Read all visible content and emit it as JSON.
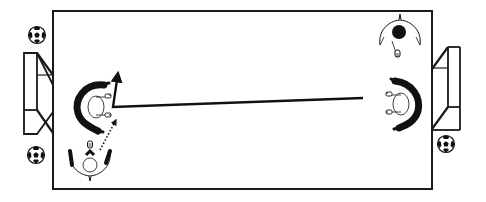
{
  "diagram": {
    "title": "Soccer passing drill",
    "field": {
      "x": 53,
      "y": 11,
      "width": 379,
      "height": 178,
      "line_color": "#1a1a1a",
      "fill": "#ffffff"
    },
    "goals": [
      {
        "id": "left-goal",
        "side": "left",
        "x": 24,
        "y": 53,
        "width": 30,
        "height": 81
      },
      {
        "id": "right-goal",
        "side": "right",
        "x": 431,
        "y": 47,
        "width": 29,
        "height": 83
      }
    ],
    "balls": [
      {
        "id": "ball-top-left",
        "cx": 37,
        "cy": 35,
        "r": 9
      },
      {
        "id": "ball-bottom-left",
        "cx": 36,
        "cy": 155,
        "r": 9
      },
      {
        "id": "ball-bottom-right",
        "cx": 446,
        "cy": 144,
        "r": 9
      }
    ],
    "players": [
      {
        "id": "player-left-keeper",
        "label": "Left player (facing right)",
        "cx": 92,
        "cy": 105,
        "facing": "right",
        "shirt": "black-arc"
      },
      {
        "id": "player-left-bottom",
        "label": "Left bottom player (facing up)",
        "cx": 90,
        "cy": 163,
        "facing": "up",
        "shirt": "white"
      },
      {
        "id": "player-right-top",
        "label": "Right top player (facing down)",
        "cx": 400,
        "cy": 35,
        "facing": "down",
        "shirt": "black-head"
      },
      {
        "id": "player-right-keeper",
        "label": "Right player (facing left)",
        "cx": 405,
        "cy": 103,
        "facing": "left",
        "shirt": "black-arc"
      }
    ],
    "paths": [
      {
        "id": "pass-line",
        "type": "solid",
        "points": [
          [
            363,
            98
          ],
          [
            113,
            107
          ],
          [
            118,
            72
          ]
        ],
        "arrow_end": true
      },
      {
        "id": "run-line",
        "type": "dotted",
        "points": [
          [
            100,
            150
          ],
          [
            117,
            118
          ]
        ],
        "arrow_end": true
      }
    ]
  }
}
